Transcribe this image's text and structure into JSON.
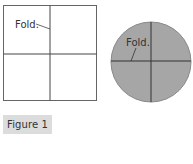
{
  "figure": {
    "caption": "Figure 1",
    "caption_bg": "#dcdcdc"
  },
  "square": {
    "fold_label": "Fold.",
    "fill": "#ffffff",
    "stroke": "#555555"
  },
  "circle": {
    "fold_label": "Fold.",
    "fill": "#a6a6a6",
    "stroke": "#444444"
  }
}
